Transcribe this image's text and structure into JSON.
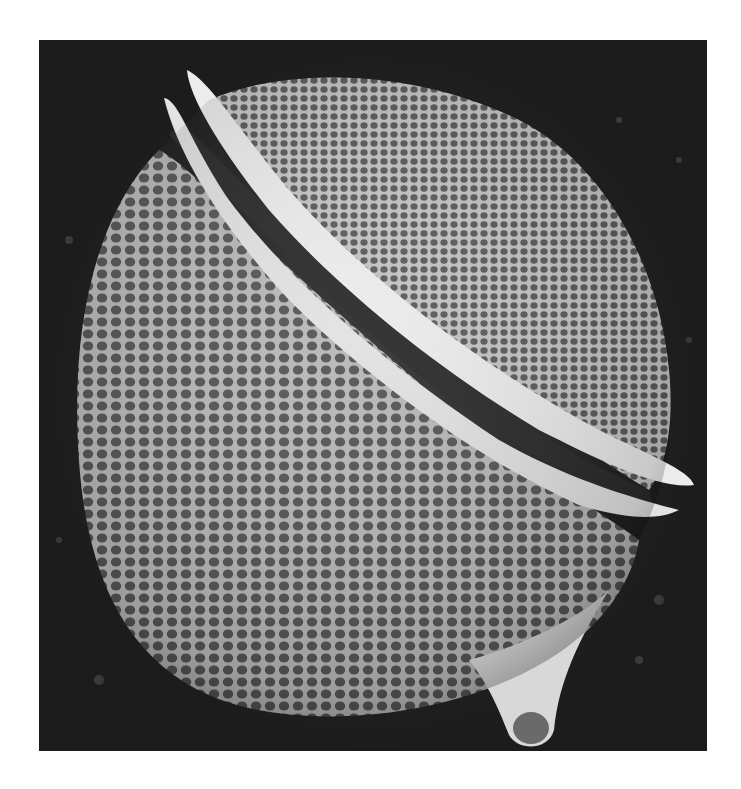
{
  "image": {
    "description": "Scanning electron micrograph of a dinoflagellate cell with reticulated (honeycomb-pitted) theca, girdle flanges, and antapical spine",
    "colors": {
      "background": "#1c1c1c",
      "cell_body": "#8a8a8a",
      "pit": "#4a4a4a",
      "pit_rim": "#c8c8c8",
      "flange": "#eeeeee",
      "page": "#ffffff"
    },
    "frame": {
      "left": 39,
      "top": 40,
      "width": 668,
      "height": 711
    }
  },
  "caption": {
    "text": ""
  }
}
